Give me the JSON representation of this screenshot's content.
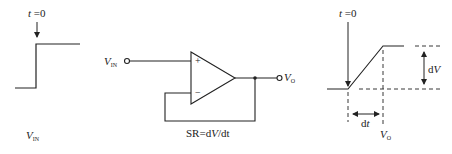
{
  "figure": {
    "left_panel": {
      "time_marker": {
        "var": "t",
        "eq": " =0"
      },
      "signal_label": {
        "var": "V",
        "sub": "IN"
      }
    },
    "middle_panel": {
      "input_label": {
        "var": "V",
        "sub": "IN"
      },
      "output_label": {
        "var": "V",
        "sub": "O"
      },
      "plus_sign": "+",
      "minus_sign": "−",
      "slew_rate_label": {
        "pre": "SR=d",
        "var": "V",
        "post": "/dt"
      }
    },
    "right_panel": {
      "time_marker": {
        "var": "t",
        "eq": " =0"
      },
      "dv_label": {
        "pre": "d",
        "var": "V"
      },
      "dt_label": {
        "pre": "d",
        "var": "t"
      },
      "signal_label": {
        "var": "V",
        "sub": "O"
      }
    },
    "colors": {
      "stroke": "#222222",
      "background": "#ffffff"
    }
  }
}
